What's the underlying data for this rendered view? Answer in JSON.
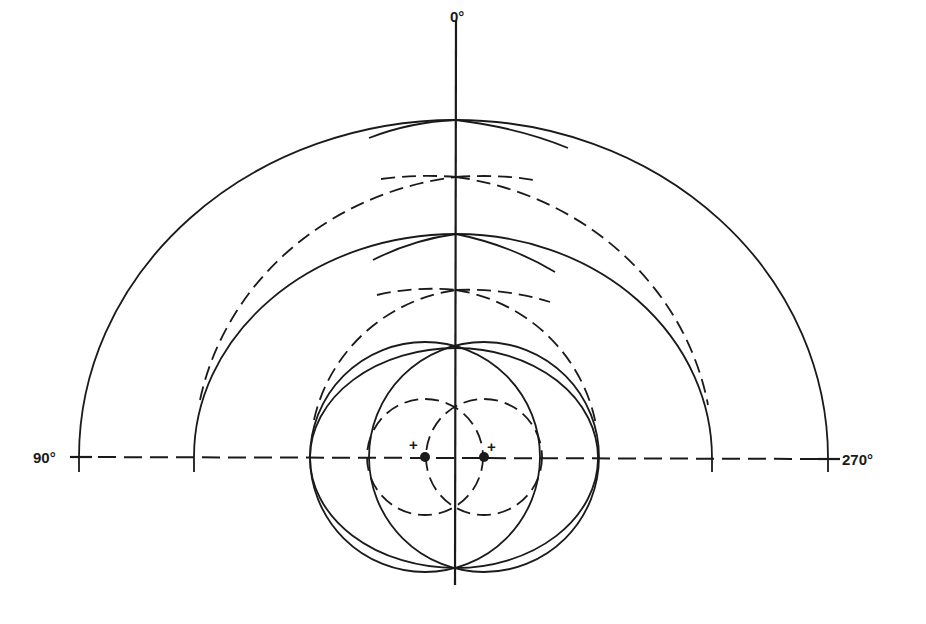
{
  "diagram": {
    "type": "two-source wavefront pattern",
    "labels": {
      "top": "0°",
      "left": "90°",
      "right": "270°"
    },
    "source_markers": {
      "left": "+",
      "right": "+"
    },
    "colors": {
      "ink": "#1a1a1a",
      "background": "#ffffff"
    }
  }
}
